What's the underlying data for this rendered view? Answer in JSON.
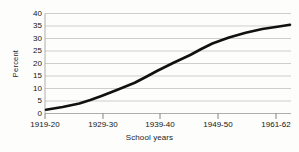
{
  "chart_data": {
    "type": "line",
    "title": "",
    "subtitle": "",
    "xlabel": "School years",
    "ylabel": "Percent",
    "categories": [
      "1919-20",
      "1929-30",
      "1939-40",
      "1949-50",
      "1961-62"
    ],
    "x": [
      1919,
      1929,
      1939,
      1949,
      1961
    ],
    "series": [
      {
        "name": "Percent",
        "values": [
          1.5,
          7,
          17,
          28,
          35
        ]
      }
    ],
    "detail_points": [
      {
        "x": 1919,
        "y": 1.5
      },
      {
        "x": 1922,
        "y": 2.6
      },
      {
        "x": 1925,
        "y": 4.0
      },
      {
        "x": 1927,
        "y": 5.4
      },
      {
        "x": 1929,
        "y": 7.0
      },
      {
        "x": 1932,
        "y": 9.6
      },
      {
        "x": 1935,
        "y": 12.3
      },
      {
        "x": 1937,
        "y": 14.6
      },
      {
        "x": 1939,
        "y": 17.0
      },
      {
        "x": 1942,
        "y": 20.3
      },
      {
        "x": 1945,
        "y": 23.4
      },
      {
        "x": 1947,
        "y": 25.8
      },
      {
        "x": 1949,
        "y": 28.0
      },
      {
        "x": 1952,
        "y": 30.4
      },
      {
        "x": 1955,
        "y": 32.3
      },
      {
        "x": 1958,
        "y": 33.8
      },
      {
        "x": 1961,
        "y": 34.8
      },
      {
        "x": 1963,
        "y": 35.5
      }
    ],
    "ylim": [
      0,
      40
    ],
    "ytick_labels": [
      "0",
      "5",
      "10",
      "15",
      "20",
      "25",
      "30",
      "35",
      "40"
    ],
    "ytick_values": [
      0,
      5,
      10,
      15,
      20,
      25,
      30,
      35,
      40
    ],
    "grid": true,
    "grid_axis": "y",
    "legend": false,
    "legend_position": "none",
    "line_color": "#111111",
    "grid_color": "#b9b9b9",
    "axis_color": "#555555",
    "background_color": "#fdfdfc"
  }
}
